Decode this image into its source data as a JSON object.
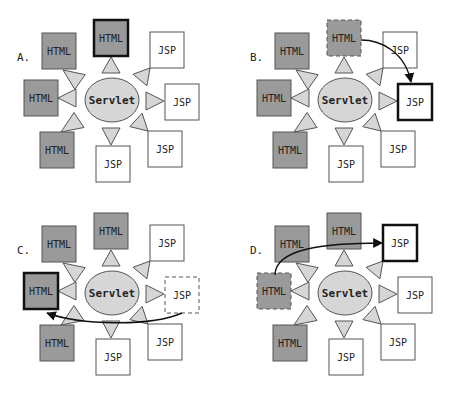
{
  "colors": {
    "html_fill": "#9a9a9a",
    "jsp_fill": "#ffffff",
    "servlet_fill": "#d6d6d6",
    "connector_fill": "#d6d6d6",
    "stroke": "#555555",
    "highlight_stroke": "#111111",
    "arrow": "#111111"
  },
  "servlet_label": "Servlet",
  "panels": [
    {
      "label": "A.",
      "offset": [
        0,
        0
      ],
      "nodes": [
        {
          "type": "HTML",
          "text": "HTML",
          "pos": "top-left",
          "style": "normal"
        },
        {
          "type": "HTML",
          "text": "HTML",
          "pos": "top",
          "style": "highlight"
        },
        {
          "type": "JSP",
          "text": "JSP",
          "pos": "top-right",
          "style": "normal"
        },
        {
          "type": "HTML",
          "text": "HTML",
          "pos": "left",
          "style": "normal"
        },
        {
          "type": "JSP",
          "text": "JSP",
          "pos": "right",
          "style": "normal"
        },
        {
          "type": "HTML",
          "text": "HTML",
          "pos": "bottom-left",
          "style": "normal"
        },
        {
          "type": "JSP",
          "text": "JSP",
          "pos": "bottom",
          "style": "normal"
        },
        {
          "type": "JSP",
          "text": "JSP",
          "pos": "bottom-right",
          "style": "normal"
        }
      ],
      "arrow": null
    },
    {
      "label": "B.",
      "offset": [
        233,
        0
      ],
      "nodes": [
        {
          "type": "HTML",
          "text": "HTML",
          "pos": "top-left",
          "style": "normal"
        },
        {
          "type": "HTML",
          "text": "HTML",
          "pos": "top",
          "style": "dashed"
        },
        {
          "type": "JSP",
          "text": "JSP",
          "pos": "top-right",
          "style": "normal"
        },
        {
          "type": "HTML",
          "text": "HTML",
          "pos": "left",
          "style": "normal"
        },
        {
          "type": "JSP",
          "text": "JSP",
          "pos": "right",
          "style": "highlight"
        },
        {
          "type": "HTML",
          "text": "HTML",
          "pos": "bottom-left",
          "style": "normal"
        },
        {
          "type": "JSP",
          "text": "JSP",
          "pos": "bottom",
          "style": "normal"
        },
        {
          "type": "JSP",
          "text": "JSP",
          "pos": "bottom-right",
          "style": "normal"
        }
      ],
      "arrow": {
        "from": "top",
        "to": "right"
      }
    },
    {
      "label": "C.",
      "offset": [
        0,
        193
      ],
      "nodes": [
        {
          "type": "HTML",
          "text": "HTML",
          "pos": "top-left",
          "style": "normal"
        },
        {
          "type": "HTML",
          "text": "HTML",
          "pos": "top",
          "style": "normal"
        },
        {
          "type": "JSP",
          "text": "JSP",
          "pos": "top-right",
          "style": "normal"
        },
        {
          "type": "HTML",
          "text": "HTML",
          "pos": "left",
          "style": "highlight"
        },
        {
          "type": "JSP",
          "text": "JSP",
          "pos": "right",
          "style": "dashed"
        },
        {
          "type": "HTML",
          "text": "HTML",
          "pos": "bottom-left",
          "style": "normal"
        },
        {
          "type": "JSP",
          "text": "JSP",
          "pos": "bottom",
          "style": "normal"
        },
        {
          "type": "JSP",
          "text": "JSP",
          "pos": "bottom-right",
          "style": "normal"
        }
      ],
      "arrow": {
        "from": "right",
        "to": "left"
      }
    },
    {
      "label": "D.",
      "offset": [
        233,
        193
      ],
      "nodes": [
        {
          "type": "HTML",
          "text": "HTML",
          "pos": "top-left",
          "style": "normal"
        },
        {
          "type": "HTML",
          "text": "HTML",
          "pos": "top",
          "style": "normal"
        },
        {
          "type": "JSP",
          "text": "JSP",
          "pos": "top-right",
          "style": "highlight"
        },
        {
          "type": "HTML",
          "text": "HTML",
          "pos": "left",
          "style": "dashed"
        },
        {
          "type": "JSP",
          "text": "JSP",
          "pos": "right",
          "style": "normal"
        },
        {
          "type": "HTML",
          "text": "HTML",
          "pos": "bottom-left",
          "style": "normal"
        },
        {
          "type": "JSP",
          "text": "JSP",
          "pos": "bottom",
          "style": "normal"
        },
        {
          "type": "JSP",
          "text": "JSP",
          "pos": "bottom-right",
          "style": "normal"
        }
      ],
      "arrow": {
        "from": "left",
        "to": "top-right"
      }
    }
  ]
}
